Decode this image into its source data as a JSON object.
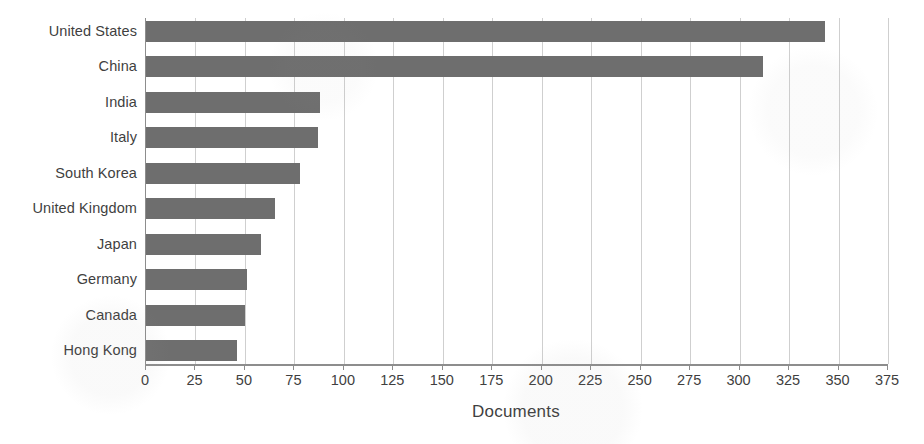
{
  "chart_data": {
    "type": "bar",
    "orientation": "horizontal",
    "title": "",
    "xlabel": "Documents",
    "ylabel": "",
    "xlim": [
      0,
      375
    ],
    "xticks": [
      0,
      25,
      50,
      75,
      100,
      125,
      150,
      175,
      200,
      225,
      250,
      275,
      300,
      325,
      350,
      375
    ],
    "grid": "vertical",
    "legend": "none",
    "bar_color": "#6e6e6e",
    "categories": [
      "United States",
      "China",
      "India",
      "Italy",
      "South Korea",
      "United Kingdom",
      "Japan",
      "Germany",
      "Canada",
      "Hong Kong"
    ],
    "values": [
      343,
      312,
      88,
      87,
      78,
      65,
      58,
      51,
      50,
      46
    ]
  }
}
